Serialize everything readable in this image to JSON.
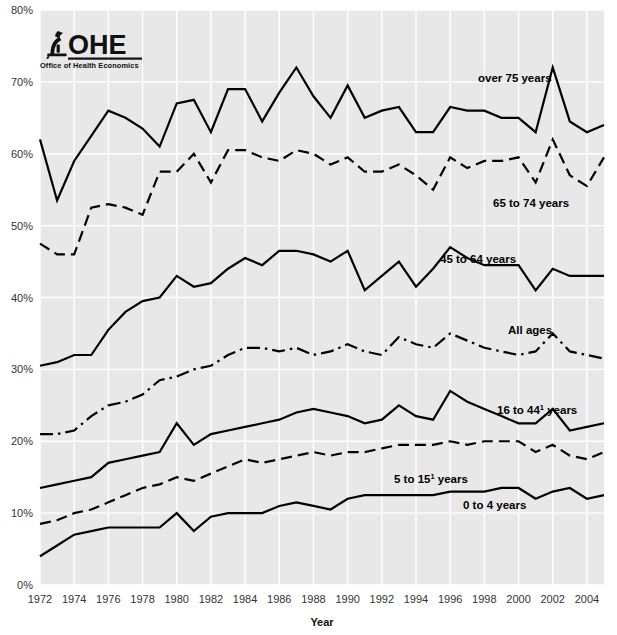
{
  "logo": {
    "mark": "microscope-icon",
    "acronym": "OHE",
    "subtitle": "Office of Health Economics"
  },
  "axes": {
    "y_ticks": [
      "0%",
      "10%",
      "20%",
      "30%",
      "40%",
      "50%",
      "60%",
      "70%",
      "80%"
    ],
    "x_ticks": [
      "1972",
      "1974",
      "1976",
      "1978",
      "1980",
      "1982",
      "1984",
      "1986",
      "1988",
      "1990",
      "1992",
      "1994",
      "1996",
      "1998",
      "2000",
      "2002",
      "2004"
    ],
    "x_title": "Year",
    "y_title": ""
  },
  "series_labels": {
    "over75": "over 75 years",
    "s65_74": "65 to 74 years",
    "s45_64": "45 to 64 years",
    "all": "All ages",
    "s16_44_a": "16 to 44",
    "s16_44_sup": "1",
    "s16_44_b": " years",
    "s5_15_a": "5 to 15",
    "s5_15_sup": "1",
    "s5_15_b": " years",
    "s0_4": "0 to 4 years"
  },
  "chart_data": {
    "type": "line",
    "title": "",
    "xlabel": "Year",
    "ylabel": "",
    "xlim": [
      1972,
      2005
    ],
    "ylim": [
      0,
      80
    ],
    "grid": true,
    "legend": "inline-annotations",
    "x": [
      1972,
      1973,
      1974,
      1975,
      1976,
      1977,
      1978,
      1979,
      1980,
      1981,
      1982,
      1983,
      1984,
      1985,
      1986,
      1987,
      1988,
      1989,
      1990,
      1991,
      1992,
      1993,
      1994,
      1995,
      1996,
      1997,
      1998,
      1999,
      2000,
      2001,
      2002,
      2003,
      2004,
      2005
    ],
    "series": [
      {
        "name": "over 75 years",
        "style": "solid",
        "values": [
          62.0,
          53.5,
          59.0,
          62.5,
          66.0,
          65.0,
          63.5,
          61.0,
          67.0,
          67.5,
          63.0,
          69.0,
          69.0,
          64.5,
          68.5,
          72.0,
          68.0,
          65.0,
          69.5,
          65.0,
          66.0,
          66.5,
          63.0,
          63.0,
          66.5,
          66.0,
          66.0,
          65.0,
          65.0,
          63.0,
          72.0,
          64.5,
          63.0,
          64.0
        ]
      },
      {
        "name": "65 to 74 years",
        "style": "dashed",
        "values": [
          47.5,
          46.0,
          46.0,
          52.5,
          53.0,
          52.5,
          51.5,
          57.5,
          57.5,
          60.0,
          56.0,
          60.5,
          60.5,
          59.5,
          59.0,
          60.5,
          60.0,
          58.5,
          59.5,
          57.5,
          57.5,
          58.5,
          57.0,
          55.0,
          59.5,
          58.0,
          59.0,
          59.0,
          59.5,
          56.0,
          62.0,
          57.0,
          55.5,
          59.5
        ]
      },
      {
        "name": "45 to 64 years",
        "style": "solid",
        "values": [
          30.5,
          31.0,
          32.0,
          32.0,
          35.5,
          38.0,
          39.5,
          40.0,
          43.0,
          41.5,
          42.0,
          44.0,
          45.5,
          44.5,
          46.5,
          46.5,
          46.0,
          45.0,
          46.5,
          41.0,
          43.0,
          45.0,
          41.5,
          44.0,
          47.0,
          45.5,
          44.5,
          44.5,
          44.5,
          41.0,
          44.0,
          43.0,
          43.0,
          43.0
        ]
      },
      {
        "name": "All ages",
        "style": "dashdot",
        "values": [
          21.0,
          21.0,
          21.5,
          23.5,
          25.0,
          25.5,
          26.5,
          28.5,
          29.0,
          30.0,
          30.5,
          32.0,
          33.0,
          33.0,
          32.5,
          33.0,
          32.0,
          32.5,
          33.5,
          32.5,
          32.0,
          34.5,
          33.5,
          33.0,
          35.0,
          34.0,
          33.0,
          32.5,
          32.0,
          32.5,
          35.0,
          32.5,
          32.0,
          31.5
        ]
      },
      {
        "name": "16 to 44 years",
        "style": "solid",
        "values": [
          13.5,
          14.0,
          14.5,
          15.0,
          17.0,
          17.5,
          18.0,
          18.5,
          22.5,
          19.5,
          21.0,
          21.5,
          22.0,
          22.5,
          23.0,
          24.0,
          24.5,
          24.0,
          23.5,
          22.5,
          23.0,
          25.0,
          23.5,
          23.0,
          27.0,
          25.5,
          24.5,
          23.5,
          22.5,
          22.5,
          24.5,
          21.5,
          22.0,
          22.5
        ]
      },
      {
        "name": "5 to 15 years",
        "style": "dashed",
        "values": [
          8.5,
          9.0,
          10.0,
          10.5,
          11.5,
          12.5,
          13.5,
          14.0,
          15.0,
          14.5,
          15.5,
          16.5,
          17.5,
          17.0,
          17.5,
          18.0,
          18.5,
          18.0,
          18.5,
          18.5,
          19.0,
          19.5,
          19.5,
          19.5,
          20.0,
          19.5,
          20.0,
          20.0,
          20.0,
          18.5,
          19.5,
          18.0,
          17.5,
          18.5
        ]
      },
      {
        "name": "0 to 4 years",
        "style": "solid",
        "values": [
          4.0,
          5.5,
          7.0,
          7.5,
          8.0,
          8.0,
          8.0,
          8.0,
          10.0,
          7.5,
          9.5,
          10.0,
          10.0,
          10.0,
          11.0,
          11.5,
          11.0,
          10.5,
          12.0,
          12.5,
          12.5,
          12.5,
          12.5,
          12.5,
          13.0,
          13.0,
          13.0,
          13.5,
          13.5,
          12.0,
          13.0,
          13.5,
          12.0,
          12.5
        ]
      }
    ]
  }
}
